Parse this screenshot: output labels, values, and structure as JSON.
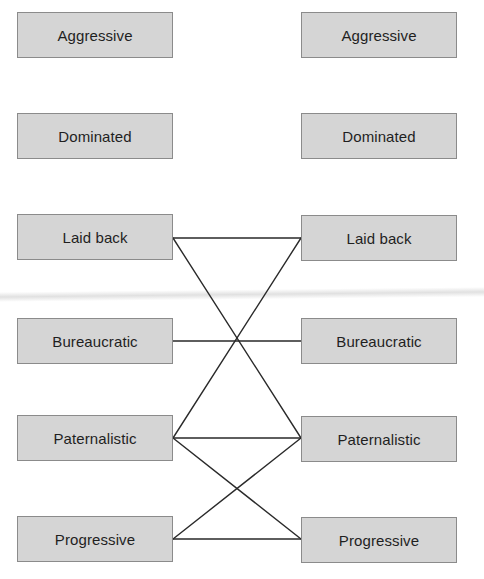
{
  "diagram": {
    "caption_visible": "",
    "style": {
      "node_fill": "#d5d5d5",
      "node_border": "#8b8b8b",
      "line_color": "#2a2a2a",
      "background": "#ffffff"
    },
    "left_column": [
      {
        "id": "L-aggressive",
        "label": "Aggressive"
      },
      {
        "id": "L-dominated",
        "label": "Dominated"
      },
      {
        "id": "L-laidback",
        "label": "Laid back"
      },
      {
        "id": "L-bureaucratic",
        "label": "Bureaucratic"
      },
      {
        "id": "L-paternalistic",
        "label": "Paternalistic"
      },
      {
        "id": "L-progressive",
        "label": "Progressive"
      }
    ],
    "right_column": [
      {
        "id": "R-aggressive",
        "label": "Aggressive"
      },
      {
        "id": "R-dominated",
        "label": "Dominated"
      },
      {
        "id": "R-laidback",
        "label": "Laid back"
      },
      {
        "id": "R-bureaucratic",
        "label": "Bureaucratic"
      },
      {
        "id": "R-paternalistic",
        "label": "Paternalistic"
      },
      {
        "id": "R-progressive",
        "label": "Progressive"
      }
    ],
    "connections": [
      {
        "from": "L-laidback",
        "to": "R-laidback"
      },
      {
        "from": "L-laidback",
        "to": "R-paternalistic"
      },
      {
        "from": "R-laidback",
        "to": "L-paternalistic"
      },
      {
        "from": "L-bureaucratic",
        "to": "R-bureaucratic"
      },
      {
        "from": "L-paternalistic",
        "to": "R-paternalistic"
      },
      {
        "from": "L-paternalistic",
        "to": "R-progressive"
      },
      {
        "from": "L-progressive",
        "to": "R-paternalistic"
      },
      {
        "from": "L-progressive",
        "to": "R-progressive"
      }
    ]
  }
}
